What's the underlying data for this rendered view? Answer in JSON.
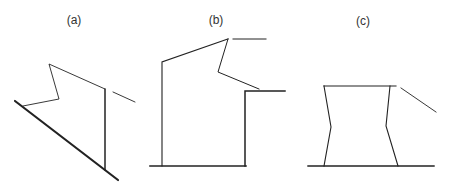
{
  "figure": {
    "width": 455,
    "height": 183,
    "background": "#ffffff",
    "line_color": "#222222",
    "panels": [
      {
        "id": "a",
        "label": "(a)",
        "label_pos": [
          74,
          14
        ],
        "description": "Thick diagonal ground line with a thin zigzag polyline and a vertical line; short detached segment at top right"
      },
      {
        "id": "b",
        "label": "(b)",
        "label_pos": [
          216,
          14
        ],
        "description": "Stepped profile: left vertical wall, sloped roof to apex, zigzag back, ledge with right vertical wall, horizontal base"
      },
      {
        "id": "c",
        "label": "(c)",
        "label_pos": [
          363,
          15
        ],
        "description": "Waisted column shape between a top horizontal line and a base line, with a short detached slanted segment at top right"
      }
    ]
  }
}
